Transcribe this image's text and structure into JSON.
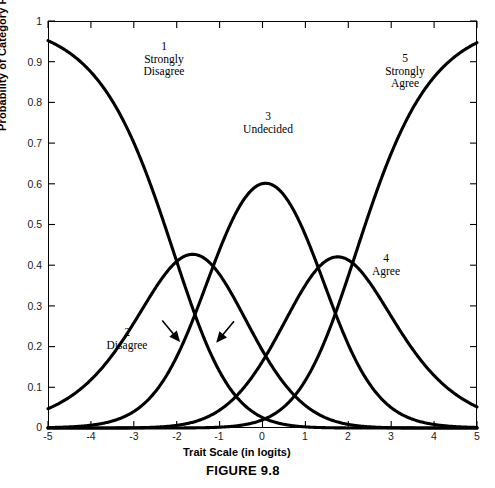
{
  "figure": {
    "caption": "FIGURE 9.8"
  },
  "axes": {
    "xlabel": "Trait Scale (in logits)",
    "ylabel": "Probability of Category Response",
    "xticks": [
      "-5",
      "-4",
      "-3",
      "-2",
      "-1",
      "0",
      "1",
      "2",
      "3",
      "4",
      "5"
    ],
    "yticks": [
      "0",
      "0.1",
      "0.2",
      "0.3",
      "0.4",
      "0.5",
      "0.6",
      "0.7",
      "0.8",
      "0.9",
      "1"
    ]
  },
  "annotations": [
    {
      "name": "category-1",
      "number": "1",
      "line1": "Strongly",
      "line2": "Disagree"
    },
    {
      "name": "category-2",
      "number": "2",
      "line1": "Disagree",
      "line2": ""
    },
    {
      "name": "category-3",
      "number": "3",
      "line1": "Undecided",
      "line2": ""
    },
    {
      "name": "category-4",
      "number": "4",
      "line1": "Agree",
      "line2": ""
    },
    {
      "name": "category-5",
      "number": "5",
      "line1": "Strongly",
      "line2": "Agree"
    }
  ],
  "chart_data": {
    "type": "line",
    "title": "FIGURE 9.8",
    "xlabel": "Trait Scale (in logits)",
    "ylabel": "Probability of Category Response",
    "xlim": [
      -5,
      5
    ],
    "ylim": [
      0,
      1
    ],
    "grid": false,
    "legend": "inline-annotations",
    "line_color": "#000000",
    "line_width": 3,
    "model": "Rating Scale Model category response curves",
    "thresholds": [
      -2.0,
      -1.15,
      1.3,
      2.1
    ],
    "x": [
      -5,
      -4.5,
      -4,
      -3.5,
      -3,
      -2.5,
      -2,
      -1.5,
      -1,
      -0.5,
      0,
      0.5,
      1,
      1.5,
      2,
      2.5,
      3,
      3.5,
      4,
      4.5,
      5
    ],
    "series": [
      {
        "name": "1 Strongly Disagree",
        "label_number": "1",
        "label_text": "Strongly Disagree",
        "values": [
          0.98,
          0.97,
          0.95,
          0.92,
          0.87,
          0.78,
          0.64,
          0.46,
          0.28,
          0.14,
          0.06,
          0.023,
          0.008,
          0.003,
          0.001,
          0.0003,
          0.0001,
          4e-05,
          1e-05,
          4e-06,
          1e-06
        ]
      },
      {
        "name": "2 Disagree",
        "label_number": "2",
        "label_text": "Disagree",
        "values": [
          0.02,
          0.03,
          0.046,
          0.068,
          0.1,
          0.15,
          0.2,
          0.225,
          0.215,
          0.165,
          0.105,
          0.058,
          0.028,
          0.012,
          0.005,
          0.0018,
          0.0006,
          0.0002,
          7e-05,
          2e-05,
          7e-06
        ],
        "peak": {
          "x": -1.5,
          "y": 0.225
        },
        "arrows": 2
      },
      {
        "name": "3 Undecided",
        "label_number": "3",
        "label_text": "Undecided",
        "values": [
          0.0008,
          0.0018,
          0.004,
          0.009,
          0.021,
          0.05,
          0.11,
          0.22,
          0.39,
          0.56,
          0.675,
          0.69,
          0.6,
          0.44,
          0.27,
          0.145,
          0.07,
          0.032,
          0.014,
          0.006,
          0.0025
        ],
        "peak": {
          "x": 0.1,
          "y": 0.68
        }
      },
      {
        "name": "4 Agree",
        "label_number": "4",
        "label_text": "Agree",
        "values": [
          1e-05,
          3e-05,
          8e-05,
          0.0002,
          0.0006,
          0.0016,
          0.004,
          0.011,
          0.028,
          0.065,
          0.13,
          0.23,
          0.33,
          0.39,
          0.4,
          0.35,
          0.27,
          0.19,
          0.12,
          0.075,
          0.045
        ],
        "peak": {
          "x": 1.75,
          "y": 0.4
        }
      },
      {
        "name": "5 Strongly Agree",
        "label_number": "5",
        "label_text": "Strongly Agree",
        "values": [
          2e-07,
          6e-07,
          1.7e-06,
          5e-06,
          1.4e-05,
          4e-05,
          0.00012,
          0.0004,
          0.0013,
          0.004,
          0.013,
          0.038,
          0.1,
          0.225,
          0.4,
          0.59,
          0.745,
          0.85,
          0.915,
          0.95,
          0.955
        ]
      }
    ],
    "annotation_arrows": [
      {
        "points_to_x": -1.95,
        "points_to_y": 0.215,
        "direction": "down-right"
      },
      {
        "points_to_x": -1.05,
        "points_to_y": 0.213,
        "direction": "down-left"
      }
    ]
  }
}
